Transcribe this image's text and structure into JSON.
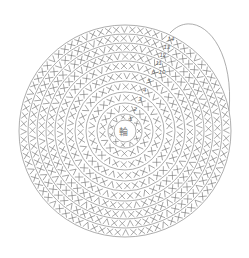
{
  "diagram": {
    "type": "crochet-round-chart",
    "center_label": "輪",
    "center": [
      125,
      131
    ],
    "stroke_color": "#8a8a8a",
    "rounds": [
      {
        "label": "1",
        "r": 17
      },
      {
        "label": "2",
        "r": 28
      },
      {
        "label": "3",
        "r": 39
      },
      {
        "label": "4",
        "r": 50
      },
      {
        "label": "5",
        "r": 60
      },
      {
        "label": "6~10",
        "r": 70
      },
      {
        "label": "11",
        "r": 79
      },
      {
        "label": "12",
        "r": 88
      },
      {
        "label": "13",
        "r": 97
      },
      {
        "label": "14",
        "r": 106
      }
    ],
    "symbols": [
      "single-crochet-x",
      "increase-v",
      "decrease-chevron"
    ]
  }
}
